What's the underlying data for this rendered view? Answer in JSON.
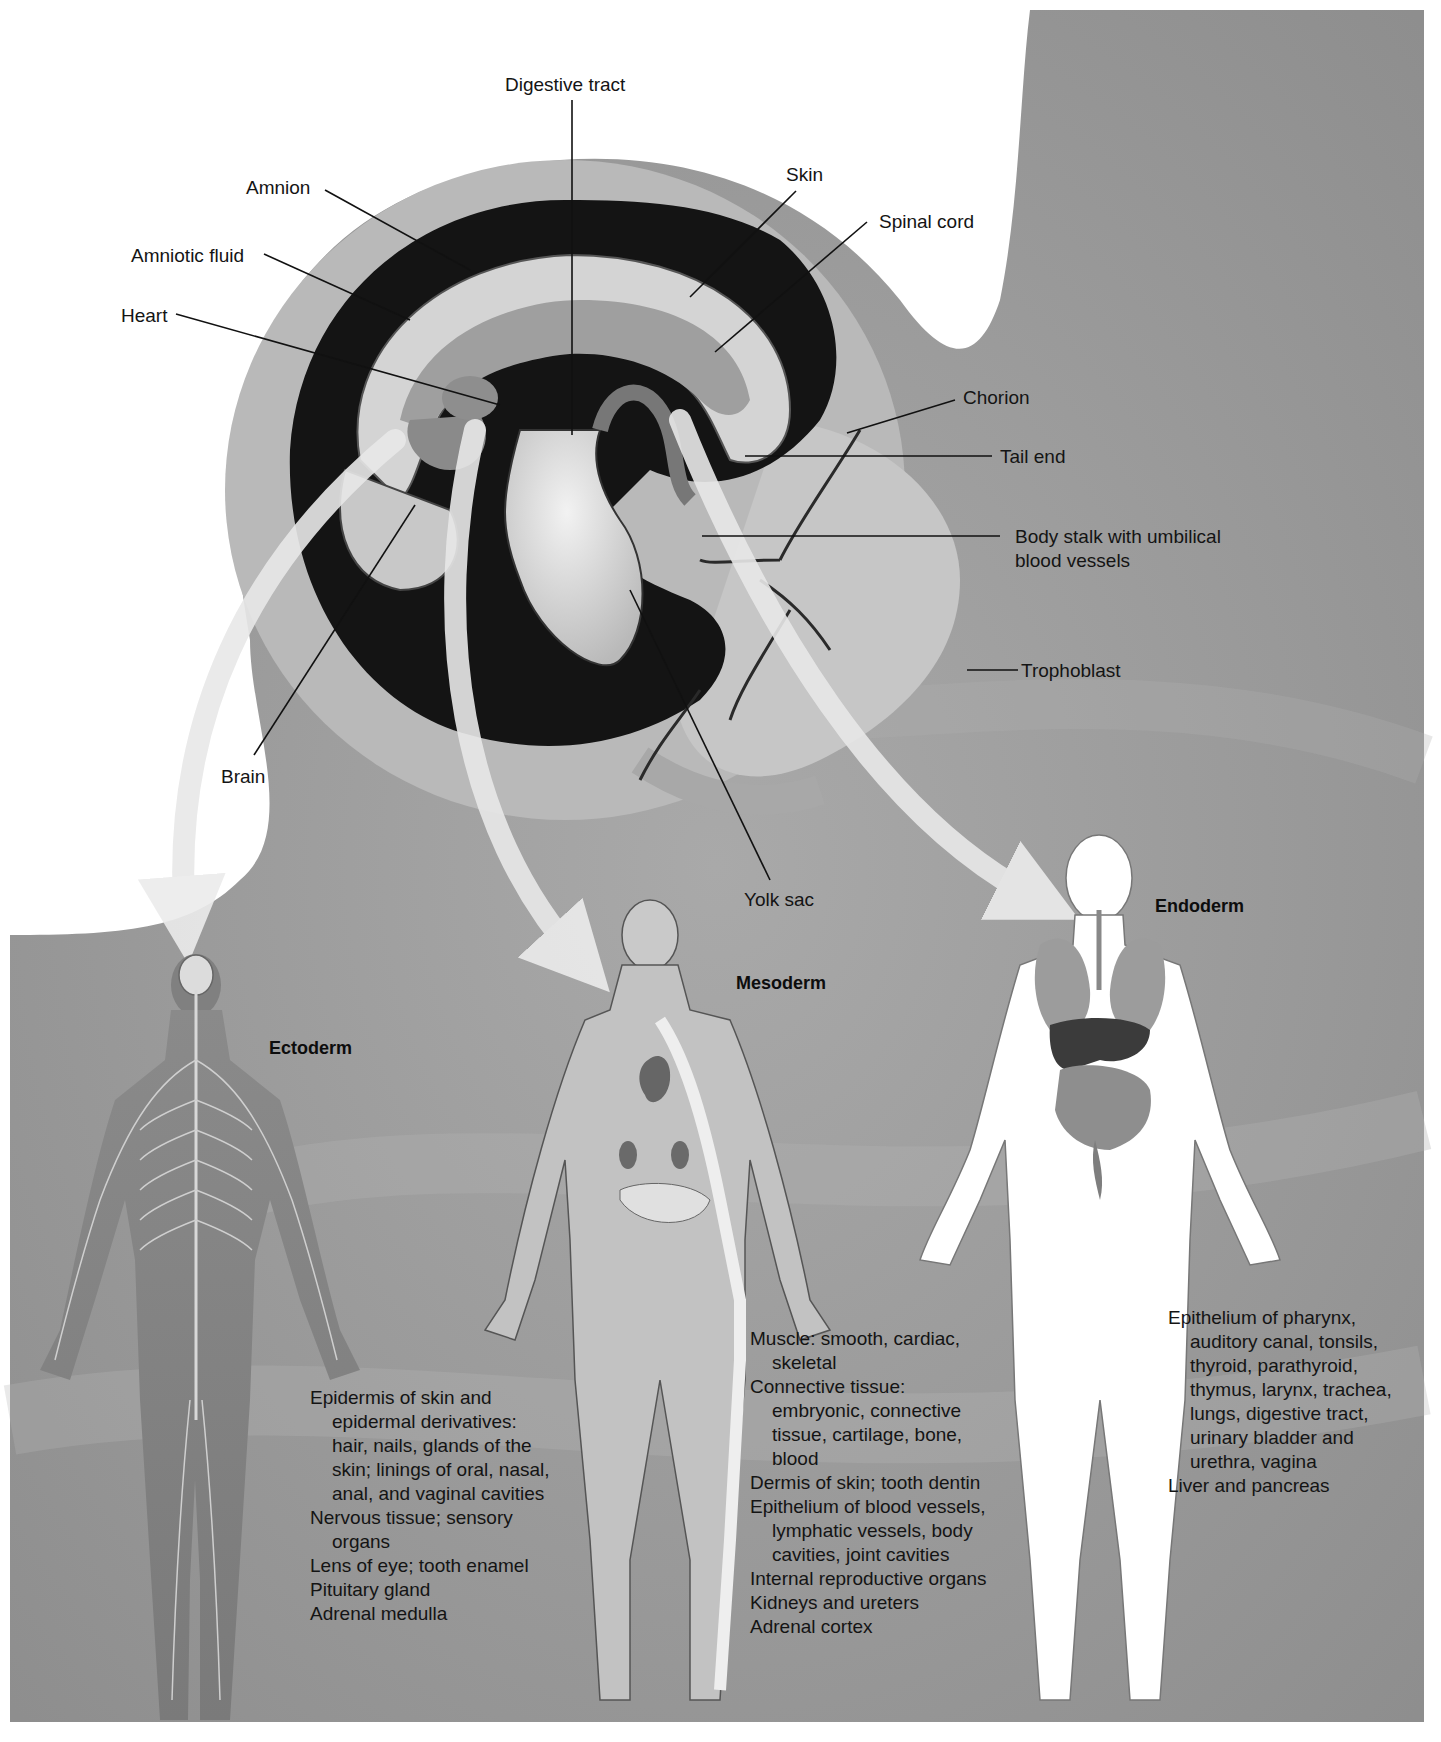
{
  "embryo": {
    "labels": {
      "digestive_tract": "Digestive tract",
      "amnion": "Amnion",
      "amniotic_fluid": "Amniotic fluid",
      "heart": "Heart",
      "brain": "Brain",
      "skin": "Skin",
      "spinal_cord": "Spinal cord",
      "chorion": "Chorion",
      "tail_end": "Tail end",
      "body_stalk_line1": "Body stalk with umbilical",
      "body_stalk_line2": "blood vessels",
      "trophoblast": "Trophoblast",
      "yolk_sac": "Yolk sac"
    }
  },
  "germ_layers": [
    {
      "title": "Ectoderm",
      "derivatives": [
        "Epidermis of skin and epidermal derivatives: hair, nails, glands of the skin; linings of oral, nasal, anal, and vaginal cavities",
        "Nervous tissue; sensory organs",
        "Lens of eye; tooth enamel",
        "Pituitary gland",
        "Adrenal medulla"
      ]
    },
    {
      "title": "Mesoderm",
      "derivatives": [
        "Muscle: smooth, cardiac, skeletal",
        "Connective tissue: embryonic, connective tissue, cartilage, bone, blood",
        "Dermis of skin; tooth dentin",
        "Epithelium of blood vessels, lymphatic vessels, body cavities, joint cavities",
        "Internal reproductive organs",
        "Kidneys and ureters",
        "Adrenal cortex"
      ]
    },
    {
      "title": "Endoderm",
      "derivatives": [
        "Epithelium of pharynx, auditory canal, tonsils, thyroid, parathyroid, thymus, larynx, trachea, lungs, digestive tract, urinary bladder and urethra, vagina",
        "Liver and pancreas"
      ]
    }
  ],
  "colors": {
    "background_tissue": "#9a9a9a",
    "amniotic_cavity": "#141414",
    "arrow": "#e6e6e6",
    "embryo_light": "#d2d2d2",
    "label_text": "#141414"
  }
}
